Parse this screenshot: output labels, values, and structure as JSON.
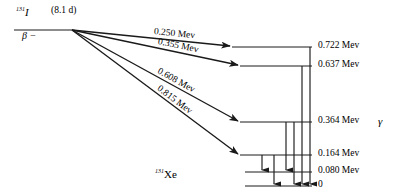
{
  "diagram": {
    "parent": {
      "mass_number": "131",
      "element": "I",
      "half_life": "(8.1 d)",
      "decay_mode": "β −"
    },
    "daughter": {
      "mass_number": "131",
      "element": "Xe"
    },
    "gamma_symbol": "γ",
    "energy_unit": "Mev",
    "levels": [
      {
        "id": "l722",
        "label": "0.722 Mev",
        "energy": 0.722,
        "y": 47,
        "x_start": 232,
        "x_end": 312
      },
      {
        "id": "l637",
        "label": "0.637 Mev",
        "energy": 0.637,
        "y": 66,
        "x_start": 240,
        "x_end": 312
      },
      {
        "id": "l364",
        "label": "0.364 Mev",
        "energy": 0.364,
        "y": 122,
        "x_start": 240,
        "x_end": 312
      },
      {
        "id": "l164",
        "label": "0.164 Mev",
        "energy": 0.164,
        "y": 155,
        "x_start": 240,
        "x_end": 312
      },
      {
        "id": "l080",
        "label": "0.080 Mev",
        "energy": 0.08,
        "y": 172,
        "x_start": 245,
        "x_end": 312
      },
      {
        "id": "l000",
        "label": "0",
        "energy": 0.0,
        "y": 186,
        "x_start": 245,
        "x_end": 312
      }
    ],
    "beta_transitions": [
      {
        "id": "b250",
        "label": "0.250 Mev",
        "energy": 0.25,
        "to_level": "l722"
      },
      {
        "id": "b355",
        "label": "0.355 Mev",
        "energy": 0.355,
        "to_level": "l637"
      },
      {
        "id": "b608",
        "label": "0.608 Mev",
        "energy": 0.608,
        "to_level": "l364"
      },
      {
        "id": "b815",
        "label": "0.815 Mev",
        "energy": 0.815,
        "to_level": "l164"
      }
    ],
    "gamma_transitions": [
      {
        "id": "g1",
        "from_level": "l164",
        "to_level": "l080",
        "x": 262
      },
      {
        "id": "g2",
        "from_level": "l164",
        "to_level": "l000",
        "x": 274
      },
      {
        "id": "g3",
        "from_level": "l364",
        "to_level": "l080",
        "x": 286
      },
      {
        "id": "g4",
        "from_level": "l364",
        "to_level": "l000",
        "x": 294
      },
      {
        "id": "g5",
        "from_level": "l637",
        "to_level": "l000",
        "x": 302
      },
      {
        "id": "g6",
        "from_level": "l722",
        "to_level": "l000",
        "x": 310
      }
    ],
    "apex": {
      "x": 72,
      "y": 30
    },
    "parent_line": {
      "x_start": 14,
      "x_end": 72,
      "y": 30
    },
    "colors": {
      "stroke": "#1a1a1a",
      "background": "#ffffff"
    }
  }
}
